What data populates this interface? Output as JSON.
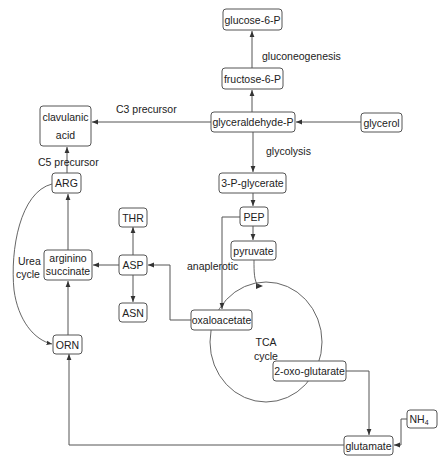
{
  "diagram": {
    "type": "metabolic-pathway",
    "nodes": {
      "glucose6p": "glucose-6-P",
      "fructose6p": "fructose-6-P",
      "glyceraldehydep": "glyceraldehyde-P",
      "glycerol": "glycerol",
      "clavulanic_line1": "clavulanic",
      "clavulanic_line2": "acid",
      "arg": "ARG",
      "arginino_line1": "arginino",
      "arginino_line2": "succinate",
      "asp": "ASP",
      "thr": "THR",
      "asn": "ASN",
      "p3glycerate": "3-P-glycerate",
      "pep": "PEP",
      "pyruvate": "pyruvate",
      "oxaloacetate": "oxaloacetate",
      "oxoglutarate": "2-oxo-glutarate",
      "orn": "ORN",
      "glutamate": "glutamate",
      "nh4_main": "NH",
      "nh4_sub": "4"
    },
    "labels": {
      "gluconeogenesis": "gluconeogenesis",
      "glycolysis": "glycolysis",
      "c3_precursor": "C3 precursor",
      "c5_precursor": "C5 precursor",
      "urea_line1": "Urea",
      "urea_line2": "cycle",
      "anaplerotic": "anaplerotic",
      "tca_line1": "TCA",
      "tca_line2": "cycle"
    },
    "edges": [
      [
        "fructose-6-P",
        "glucose-6-P"
      ],
      [
        "glyceraldehyde-P",
        "fructose-6-P"
      ],
      [
        "glycerol",
        "glyceraldehyde-P"
      ],
      [
        "glyceraldehyde-P",
        "clavulanic acid"
      ],
      [
        "ARG",
        "clavulanic acid"
      ],
      [
        "glyceraldehyde-P",
        "3-P-glycerate"
      ],
      [
        "3-P-glycerate",
        "PEP"
      ],
      [
        "PEP",
        "pyruvate"
      ],
      [
        "PEP",
        "oxaloacetate"
      ],
      [
        "pyruvate",
        "TCA cycle"
      ],
      [
        "oxaloacetate",
        "ASP"
      ],
      [
        "ASP",
        "THR"
      ],
      [
        "ASP",
        "ASN"
      ],
      [
        "ASP",
        "arginino succinate"
      ],
      [
        "arginino succinate",
        "ARG"
      ],
      [
        "ORN",
        "arginino succinate"
      ],
      [
        "ARG",
        "ORN"
      ],
      [
        "2-oxo-glutarate",
        "glutamate"
      ],
      [
        "NH4",
        "glutamate"
      ],
      [
        "glutamate",
        "ORN"
      ]
    ]
  }
}
